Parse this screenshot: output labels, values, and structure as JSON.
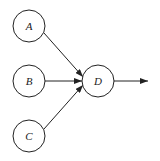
{
  "diagram": {
    "nodes": [
      {
        "id": "A",
        "label": "A",
        "cx": 29,
        "cy": 26,
        "r": 16
      },
      {
        "id": "B",
        "label": "B",
        "cx": 29,
        "cy": 81,
        "r": 16
      },
      {
        "id": "C",
        "label": "C",
        "cx": 29,
        "cy": 136,
        "r": 16
      },
      {
        "id": "D",
        "label": "D",
        "cx": 98,
        "cy": 81,
        "r": 16
      }
    ],
    "edges": [
      {
        "from": "A",
        "to": "D"
      },
      {
        "from": "B",
        "to": "D"
      },
      {
        "from": "C",
        "to": "D"
      },
      {
        "from": "D",
        "to": "output"
      }
    ],
    "colors": {
      "stroke": "#222222",
      "background": "#ffffff"
    }
  }
}
